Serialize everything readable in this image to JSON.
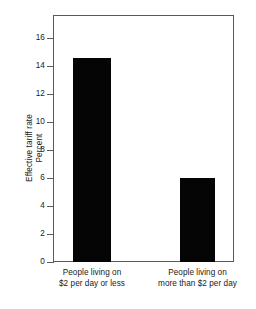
{
  "chart_data": {
    "type": "bar",
    "title": "",
    "subtitle": "",
    "xlabel": "",
    "ylabel": "Effective tariff rate",
    "ylabel_line2": "Percent",
    "ylim": [
      0,
      17.6
    ],
    "yticks": [
      0,
      2,
      4,
      6,
      8,
      10,
      12,
      14,
      16
    ],
    "ytick_labels": [
      "0",
      "2",
      "4",
      "6",
      "8",
      "10",
      "12",
      "14",
      "16"
    ],
    "grid": false,
    "legend": false,
    "legend_position": "none",
    "bar_color": "#050505",
    "categories": [
      "People living on $2 per day or less",
      "People living on more than $2 per day"
    ],
    "category_lines": [
      [
        "People living on",
        "$2 per day or less"
      ],
      [
        "People living on",
        "more than $2 per day"
      ]
    ],
    "values": [
      14.6,
      6.0
    ],
    "units": "percent"
  }
}
